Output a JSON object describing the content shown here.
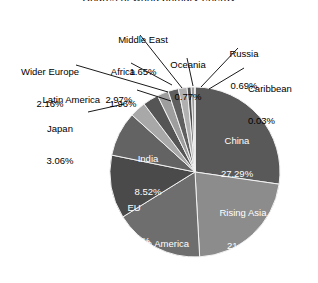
{
  "figure": {
    "background_color": "#ffffff",
    "clipped_title": "Shares of world primary energy",
    "stroke_color": "#f2f2f2",
    "leader_line_color": "#000000"
  },
  "chart_data": {
    "type": "pie",
    "title": "",
    "xlabel": "",
    "ylabel": "",
    "legend_position": "none",
    "grid": false,
    "start_angle_deg": 0,
    "direction": "clockwise",
    "units": "percent",
    "total": 100.0,
    "categories": [
      "China",
      "Rising Asia",
      "North America",
      "EU",
      "India",
      "Japan",
      "Latin America",
      "Wider Europe",
      "Africa",
      "Middle East",
      "Oceania",
      "Russia",
      "Caribbean"
    ],
    "values": [
      27.29,
      21.84,
      17.02,
      12.05,
      8.52,
      3.06,
      2.97,
      2.16,
      1.96,
      1.65,
      0.77,
      0.69,
      0.03
    ],
    "slices": [
      {
        "name": "China",
        "value": 27.29,
        "label": "China",
        "value_label": "27.29%",
        "color": "#595959",
        "label_placement": "inside"
      },
      {
        "name": "Rising Asia",
        "value": 21.84,
        "label": "Rising Asia",
        "value_label": "21.84%",
        "color": "#8c8c8c",
        "label_placement": "inside"
      },
      {
        "name": "North America",
        "value": 17.02,
        "label": "North America",
        "value_label": "17.02%",
        "color": "#6e6e6e",
        "label_placement": "inside"
      },
      {
        "name": "EU",
        "value": 12.05,
        "label": "EU",
        "value_label": "12.05%",
        "color": "#4a4a4a",
        "label_placement": "inside"
      },
      {
        "name": "India",
        "value": 8.52,
        "label": "India",
        "value_label": "8.52%",
        "color": "#636363",
        "label_placement": "inside"
      },
      {
        "name": "Japan",
        "value": 3.06,
        "label": "Japan",
        "value_label": "3.06%",
        "color": "#a8a8a8",
        "label_placement": "outside"
      },
      {
        "name": "Latin America",
        "value": 2.97,
        "label": "Latin America",
        "value_label": "2.97%",
        "color": "#555555",
        "label_placement": "outside"
      },
      {
        "name": "Wider Europe",
        "value": 2.16,
        "label": "Wider Europe",
        "value_label": "2.16%",
        "color": "#9e9e9e",
        "label_placement": "outside"
      },
      {
        "name": "Africa",
        "value": 1.96,
        "label": "Africa",
        "value_label": "1.96%",
        "color": "#5f5f5f",
        "label_placement": "outside"
      },
      {
        "name": "Middle East",
        "value": 1.65,
        "label": "Middle East",
        "value_label": "1.65%",
        "color": "#b0b0b0",
        "label_placement": "outside"
      },
      {
        "name": "Oceania",
        "value": 0.77,
        "label": "Oceania",
        "value_label": "0.77%",
        "color": "#4f4f4f",
        "label_placement": "outside"
      },
      {
        "name": "Russia",
        "value": 0.69,
        "label": "Russia",
        "value_label": "0.69%",
        "color": "#9a9a9a",
        "label_placement": "outside"
      },
      {
        "name": "Caribbean",
        "value": 0.03,
        "label": "Caribbean",
        "value_label": "0.03%",
        "color": "#3f3f3f",
        "label_placement": "outside"
      }
    ]
  },
  "labels": {
    "china": {
      "name": "China",
      "pct": "27.29%"
    },
    "rising_asia": {
      "name": "Rising Asia",
      "pct": "21.84%"
    },
    "north_america": {
      "name": "North America",
      "pct": "17.02%"
    },
    "eu": {
      "name": "EU",
      "pct": "12.05%"
    },
    "india": {
      "name": "India",
      "pct": "8.52%"
    },
    "japan": {
      "name": "Japan",
      "pct": "3.06%"
    },
    "latin_america": {
      "name": "Latin America",
      "pct": "2.97%"
    },
    "latin_america_inline": "Latin America  2.97%",
    "wider_europe": {
      "name": "Wider Europe",
      "pct": "2.16%"
    },
    "africa": {
      "name": "Africa",
      "pct": "1.96%"
    },
    "middle_east": {
      "name": "Middle East",
      "pct": "1.65%"
    },
    "oceania": {
      "name": "Oceania",
      "pct": "0.77%"
    },
    "russia": {
      "name": "Russia",
      "pct": "0.69%"
    },
    "caribbean": {
      "name": "Caribbean",
      "pct": "0.03%"
    }
  }
}
